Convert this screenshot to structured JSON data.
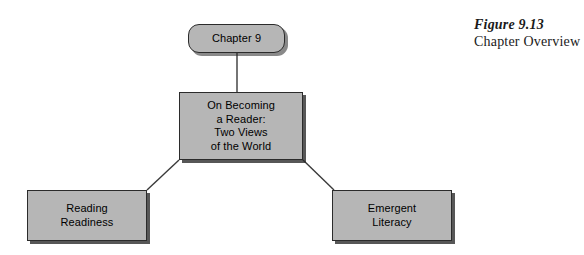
{
  "figure": {
    "number": "Figure 9.13",
    "title": "Chapter Overview"
  },
  "diagram": {
    "type": "hierarchy-tree",
    "nodes": {
      "root": {
        "label": "Chapter 9",
        "shape": "rounded-rectangle"
      },
      "main": {
        "label": "On Becoming\na Reader:\nTwo Views\nof the World",
        "shape": "rectangle"
      },
      "left": {
        "label": "Reading\nReadiness",
        "shape": "rectangle"
      },
      "right": {
        "label": "Emergent\nLiteracy",
        "shape": "rectangle"
      }
    },
    "edges": [
      {
        "from": "root",
        "to": "main",
        "style": "vertical-line"
      },
      {
        "from": "main",
        "to": "left",
        "style": "diagonal-line"
      },
      {
        "from": "main",
        "to": "right",
        "style": "diagonal-line"
      }
    ],
    "colors": {
      "node_fill": "#b6b6b6",
      "node_border": "#2b2b2b",
      "connector": "#3a3a3a",
      "text": "#000000",
      "background": "#ffffff"
    }
  }
}
